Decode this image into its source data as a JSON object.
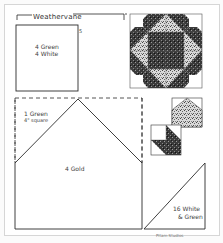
{
  "pattern": {
    "title": "Weathervane",
    "credit": "Pitam Studios"
  },
  "pieces": {
    "square": {
      "line1": "4 Green",
      "line2": "4 White",
      "marker": "5"
    },
    "dashed_square": {
      "line1": "1 Green",
      "line2": "4\" square"
    },
    "house": {
      "label": "4 Gold"
    },
    "triangle": {
      "line1": "16 White",
      "line2": "& Green"
    }
  },
  "colors": {
    "ink": "#2a2a2a",
    "dark_fabric": "#2b2b2b",
    "light_fabric": "#bdbdbd",
    "paper": "#ffffff",
    "border": "#d6d6d6"
  }
}
